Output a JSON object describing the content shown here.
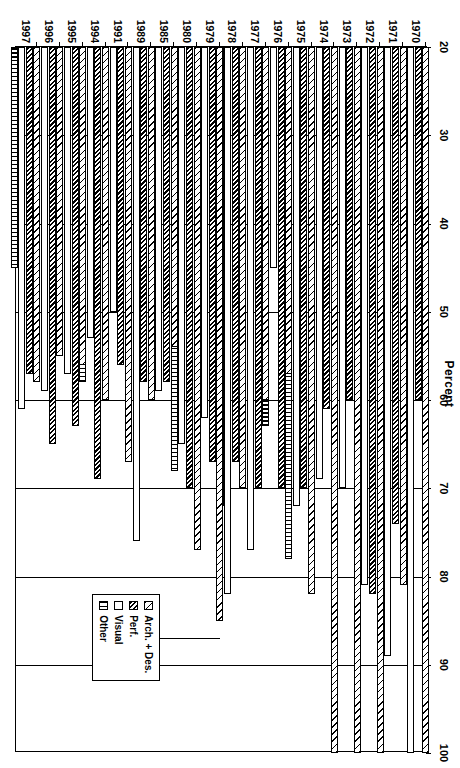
{
  "chart_data": {
    "type": "bar",
    "orientation": "horizontal",
    "title": "Percent",
    "xlabel": "Percent",
    "ylabel": "",
    "xlim": [
      20,
      100
    ],
    "xticks": [
      20,
      30,
      40,
      50,
      60,
      70,
      80,
      90,
      100
    ],
    "grid": true,
    "legend_position": "inside-lower-right",
    "categories": [
      "1970",
      "1971",
      "1972",
      "1973",
      "1974",
      "1975",
      "1976",
      "1977",
      "1978",
      "1979",
      "1980",
      "1985",
      "1989",
      "1991",
      "1994",
      "1995",
      "1996",
      "1997"
    ],
    "series": [
      {
        "name": "Arch. + Des.",
        "pattern": "light-diagonal-hatch",
        "values": [
          100,
          81,
          100,
          100,
          100,
          82,
          57,
          60,
          70,
          85,
          77,
          54,
          60,
          67,
          60,
          56,
          55,
          58
        ]
      },
      {
        "name": "Perf.",
        "pattern": "dense-dark-diagonal-hatch",
        "values": [
          60,
          74,
          82,
          60,
          61,
          70,
          70,
          70,
          67,
          67,
          70,
          58,
          58,
          56,
          69,
          63,
          65,
          57
        ]
      },
      {
        "name": "Visual",
        "pattern": "white-open",
        "values": [
          100,
          89,
          81,
          70,
          69,
          72,
          45,
          77,
          82,
          62,
          65,
          59,
          76,
          50,
          53,
          57,
          59,
          61
        ]
      },
      {
        "name": "Other",
        "pattern": "vertical-brick",
        "values": [
          80,
          74,
          67,
          60,
          60,
          78,
          63,
          70,
          72,
          70,
          68,
          56,
          51,
          48,
          58,
          55,
          53,
          45
        ]
      }
    ]
  },
  "legend": {
    "items": [
      {
        "label": "Arch. + Des."
      },
      {
        "label": "Perf."
      },
      {
        "label": "Visual"
      },
      {
        "label": "Other"
      }
    ]
  },
  "colors": {
    "ink": "#000000",
    "paper": "#ffffff"
  }
}
